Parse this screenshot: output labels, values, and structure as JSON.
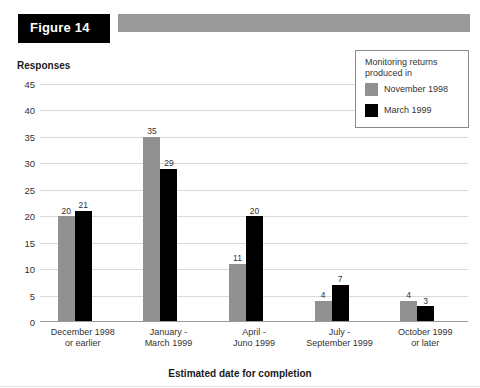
{
  "figure": {
    "tag_label": "Figure 14",
    "banner_color": "#9a9a9a",
    "tag_background": "#000000"
  },
  "chart_data": {
    "type": "bar",
    "title": "Figure 14",
    "xlabel": "Estimated date for completion",
    "ylabel": "Responses",
    "ylim": [
      0,
      45
    ],
    "ytick_step": 5,
    "yticks": [
      "45",
      "40",
      "35",
      "30",
      "25",
      "20",
      "15",
      "10",
      "5",
      "0"
    ],
    "grid": true,
    "legend_position": "top-right",
    "legend_title": "Monitoring returns produced in",
    "categories": [
      "December 1998 or earlier",
      "January - March 1999",
      "April - Juno 1999",
      "July - September 1999",
      "October 1999 or later"
    ],
    "category_lines": [
      [
        "December 1998",
        "or earlier"
      ],
      [
        "January -",
        "March 1999"
      ],
      [
        "April -",
        "Juno 1999"
      ],
      [
        "July -",
        "September 1999"
      ],
      [
        "October 1999",
        "or later"
      ]
    ],
    "series": [
      {
        "name": "November 1998",
        "color": "#919191",
        "values": [
          20,
          35,
          11,
          4,
          4
        ]
      },
      {
        "name": "March 1999",
        "color": "#000000",
        "values": [
          21,
          29,
          20,
          7,
          3
        ]
      }
    ]
  },
  "legend": {
    "title_line1": "Monitoring returns",
    "title_line2": "produced in",
    "entries": [
      {
        "label": "November 1998",
        "color": "#919191"
      },
      {
        "label": "March 1999",
        "color": "#000000"
      }
    ]
  }
}
